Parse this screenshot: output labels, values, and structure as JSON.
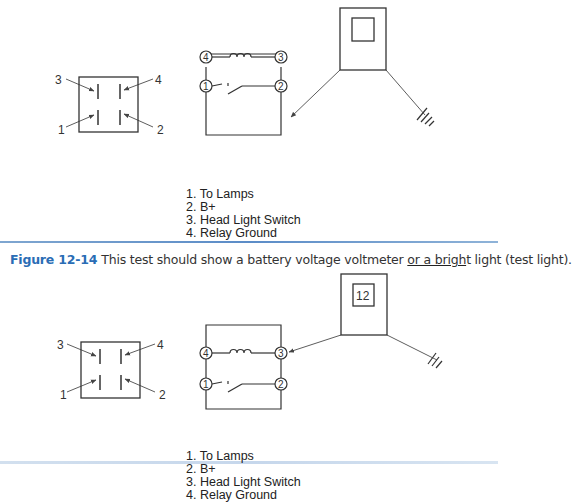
{
  "figure_top": {
    "connector_labels": [
      "3",
      "4",
      "1",
      "2"
    ],
    "relay_pins": [
      "4",
      "3",
      "1",
      "2"
    ],
    "meter_display": "",
    "legend": [
      "1. To Lamps",
      "2. B+",
      "3. Head Light Switch",
      "4. Relay Ground"
    ]
  },
  "caption": {
    "figure_label": "Figure 12-14",
    "text_before": "This test should show a battery voltage voltmeter ",
    "text_underlined": "or a brigh",
    "text_after": "t light (test light)."
  },
  "figure_bottom": {
    "connector_labels": [
      "3",
      "4",
      "1",
      "2"
    ],
    "relay_pins": [
      "4",
      "3",
      "1",
      "2"
    ],
    "meter_display": "12",
    "legend": [
      "1. To Lamps",
      "2. B+",
      "3. Head Light Switch",
      "4. Relay Ground"
    ]
  },
  "colors": {
    "caption_label": "#2a6db5",
    "divider": "#5b8cc7",
    "line": "#333333"
  }
}
